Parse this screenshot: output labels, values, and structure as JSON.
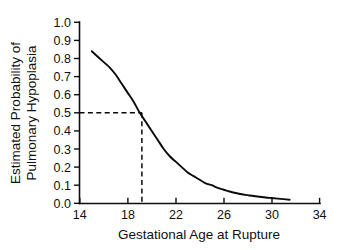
{
  "chart_data": {
    "type": "line",
    "title": "",
    "xlabel": "Gestational Age at Rupture",
    "ylabel": "Estimated Probability of Pulmonary Hypoplasia",
    "ylabel_line1": "Estimated Probability of",
    "ylabel_line2": "Pulmonary Hypoplasia",
    "xlim": [
      14,
      34
    ],
    "ylim": [
      0.0,
      1.0
    ],
    "grid": false,
    "legend": "none",
    "xticks": [
      14,
      18,
      22,
      26,
      30,
      34
    ],
    "xtick_labels": [
      "14",
      "18",
      "22",
      "26",
      "30",
      "34"
    ],
    "yticks": [
      0.0,
      0.1,
      0.2,
      0.3,
      0.4,
      0.5,
      0.6,
      0.7,
      0.8,
      0.9,
      1.0
    ],
    "ytick_labels": [
      "0.0",
      "0.1",
      "0.2",
      "0.3",
      "0.4",
      "0.5",
      "0.6",
      "0.7",
      "0.8",
      "0.9",
      "1.0"
    ],
    "series": [
      {
        "name": "Estimated probability of pulmonary hypoplasia",
        "x": [
          15.0,
          15.5,
          16.0,
          16.5,
          17.0,
          17.5,
          18.0,
          18.5,
          19.0,
          19.5,
          20.0,
          20.5,
          21.0,
          21.5,
          22.0,
          22.5,
          23.0,
          23.5,
          24.0,
          24.5,
          25.0,
          25.5,
          26.0,
          26.5,
          27.0,
          27.5,
          28.0,
          28.5,
          29.0,
          29.5,
          30.0,
          30.5,
          31.0,
          31.5
        ],
        "values": [
          0.84,
          0.81,
          0.78,
          0.75,
          0.71,
          0.66,
          0.61,
          0.56,
          0.5,
          0.45,
          0.4,
          0.35,
          0.3,
          0.26,
          0.23,
          0.2,
          0.17,
          0.15,
          0.13,
          0.11,
          0.1,
          0.085,
          0.075,
          0.065,
          0.057,
          0.05,
          0.045,
          0.04,
          0.036,
          0.032,
          0.029,
          0.026,
          0.023,
          0.02
        ]
      }
    ],
    "annotations": [
      {
        "name": "median-reference-lines",
        "style": "dashed",
        "probability": 0.5,
        "gestational_age": 19.0,
        "description": "Dashed reference lines from the 0.5 probability tick across to the curve and down to the x-axis near 19 weeks"
      }
    ],
    "colors": {
      "curve": "#0a0a0a",
      "axis": "#0d0d0d",
      "text": "#101010",
      "background": "#ffffff"
    }
  }
}
